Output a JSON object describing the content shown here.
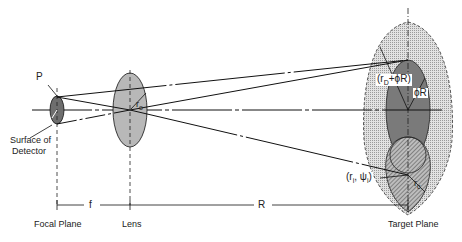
{
  "figure": {
    "type": "optical geometry diagram",
    "labels": {
      "point_p": "P",
      "detector_radius": "r",
      "detector_radius_sub": "D",
      "surface_of_detector_line1": "Surface of",
      "surface_of_detector_line2": "Detector",
      "lens_radius": "r",
      "lens_radius_sub": "o",
      "outer_radius": "(r",
      "outer_radius_sub": "D",
      "outer_radius_tail": "+ϕR)",
      "phi_r": "ϕR",
      "image_point": "(r",
      "image_point_sub": "i",
      "image_point_mid": ", ψ",
      "image_point_sub2": "i",
      "image_point_tail": ")",
      "spot_radius": "r",
      "spot_radius_sub": "c",
      "dim_f": "f",
      "dim_R": "R",
      "focal_plane": "Focal Plane",
      "lens": "Lens",
      "target_plane": "Target Plane"
    },
    "colors": {
      "line": "#1a1a1a",
      "detector_fill": "#6e6e6e",
      "lens_fill": "#b8b8b8",
      "outer_fill": "#d6d6d6",
      "inner_fill": "#7a7a7a",
      "hatch_fill": "#a0a0a0"
    }
  }
}
